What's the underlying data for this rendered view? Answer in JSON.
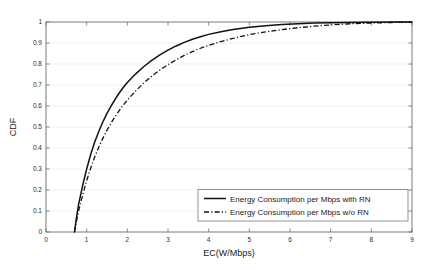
{
  "chart_data": {
    "type": "line",
    "title": "",
    "xlabel": "EC(W/Mbps)",
    "ylabel": "CDF",
    "xlim": [
      0,
      9
    ],
    "ylim": [
      0,
      1
    ],
    "grid": "horizontal",
    "legend_position": "lower right",
    "xticks": [
      "0",
      "1",
      "2",
      "3",
      "4",
      "5",
      "6",
      "7",
      "8",
      "9"
    ],
    "yticks": [
      "0",
      "0.1",
      "0.2",
      "0.3",
      "0.4",
      "0.5",
      "0.6",
      "0.7",
      "0.8",
      "0.9",
      "1"
    ],
    "series": [
      {
        "name": "Energy Consumption per Mbps with RN",
        "style": "solid",
        "color": "#111111",
        "x": [
          0.7,
          0.75,
          0.8,
          0.9,
          1.0,
          1.1,
          1.2,
          1.3,
          1.4,
          1.5,
          1.6,
          1.7,
          1.8,
          1.9,
          2.0,
          2.2,
          2.4,
          2.6,
          2.8,
          3.0,
          3.2,
          3.4,
          3.6,
          3.8,
          4.0,
          4.3,
          4.6,
          5.0,
          5.4,
          5.8,
          6.2,
          6.6,
          7.0,
          7.5,
          8.0,
          8.6,
          9.0
        ],
        "y": [
          0.0,
          0.07,
          0.13,
          0.22,
          0.3,
          0.37,
          0.43,
          0.48,
          0.525,
          0.565,
          0.6,
          0.632,
          0.662,
          0.688,
          0.712,
          0.752,
          0.787,
          0.817,
          0.843,
          0.866,
          0.886,
          0.903,
          0.918,
          0.93,
          0.941,
          0.954,
          0.964,
          0.975,
          0.982,
          0.988,
          0.992,
          0.995,
          0.997,
          0.998,
          0.999,
          1.0,
          1.0
        ]
      },
      {
        "name": "Energy Consumption per Mbps w/o RN",
        "style": "dash-dot",
        "color": "#111111",
        "x": [
          0.7,
          0.75,
          0.8,
          0.9,
          1.0,
          1.1,
          1.2,
          1.3,
          1.4,
          1.5,
          1.6,
          1.7,
          1.8,
          1.9,
          2.0,
          2.2,
          2.4,
          2.6,
          2.8,
          3.0,
          3.2,
          3.4,
          3.6,
          3.8,
          4.0,
          4.3,
          4.6,
          5.0,
          5.4,
          5.8,
          6.2,
          6.6,
          7.0,
          7.5,
          8.0,
          8.6,
          9.0
        ],
        "y": [
          0.0,
          0.05,
          0.1,
          0.175,
          0.245,
          0.305,
          0.358,
          0.405,
          0.447,
          0.485,
          0.519,
          0.55,
          0.578,
          0.604,
          0.628,
          0.671,
          0.709,
          0.742,
          0.771,
          0.797,
          0.82,
          0.841,
          0.859,
          0.875,
          0.889,
          0.907,
          0.922,
          0.94,
          0.953,
          0.964,
          0.973,
          0.98,
          0.986,
          0.992,
          0.995,
          0.998,
          0.999
        ]
      }
    ]
  },
  "legend": {
    "entries": [
      {
        "label": "Energy Consumption per Mbps with RN"
      },
      {
        "label": "Energy Consumption per Mbps w/o RN"
      }
    ]
  }
}
